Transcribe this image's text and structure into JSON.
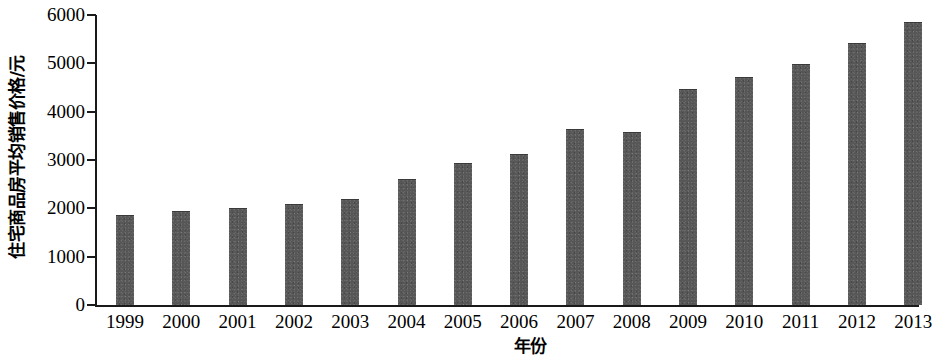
{
  "chart_data": {
    "type": "bar",
    "title": "",
    "xlabel": "年份",
    "ylabel": "住宅商品房平均销售价格/元",
    "categories": [
      "1999",
      "2000",
      "2001",
      "2002",
      "2003",
      "2004",
      "2005",
      "2006",
      "2007",
      "2008",
      "2009",
      "2010",
      "2011",
      "2012",
      "2013"
    ],
    "values": [
      1857,
      1948,
      2017,
      2092,
      2197,
      2608,
      2937,
      3119,
      3645,
      3576,
      4459,
      4725,
      4993,
      5430,
      5850
    ],
    "ylim": [
      0,
      6000
    ],
    "y_ticks": [
      0,
      1000,
      2000,
      3000,
      4000,
      5000,
      6000
    ],
    "y_tick_labels": [
      "0",
      "1000",
      "2000",
      "3000",
      "4000",
      "5000",
      "6000"
    ],
    "grid": false,
    "legend": false,
    "bar_color": "#575757",
    "axis_color": "#1a1a1a"
  }
}
